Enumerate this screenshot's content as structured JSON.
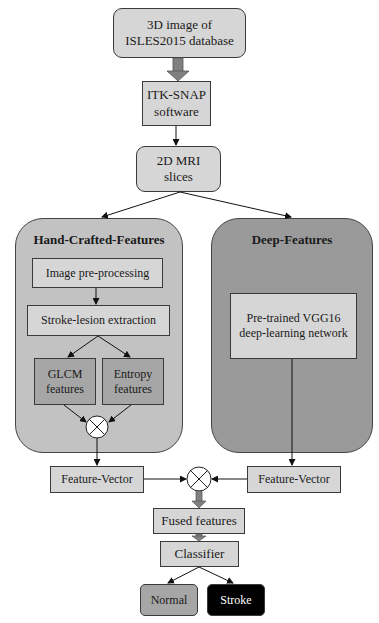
{
  "nodes": {
    "source": "3D image of\nISLES2015 database",
    "source_l1": "3D image of",
    "source_l2": "ISLES2015 database",
    "itk_l1": "ITK-SNAP",
    "itk_l2": "software",
    "mri_l1": "2D MRI",
    "mri_l2": "slices",
    "preprocessing": "Image pre-processing",
    "lesion": "Stroke-lesion extraction",
    "glcm_l1": "GLCM",
    "glcm_l2": "features",
    "entropy_l1": "Entropy",
    "entropy_l2": "features",
    "vgg_l1": "Pre-trained VGG16",
    "vgg_l2": "deep-learning network",
    "fv_left": "Feature-Vector",
    "fv_right": "Feature-Vector",
    "fused": "Fused features",
    "classifier": "Classifier",
    "normal": "Normal",
    "stroke": "Stroke"
  },
  "panels": {
    "hand_crafted": "Hand-Crafted-Features",
    "deep": "Deep-Features"
  },
  "colors": {
    "light_box": "#d6d6d6",
    "mid_box": "#a6a6a6",
    "left_panel": "#c2c2c2",
    "right_panel": "#9a9a9a",
    "stroke_box": "#000000",
    "thick_arrow": "#808080"
  }
}
